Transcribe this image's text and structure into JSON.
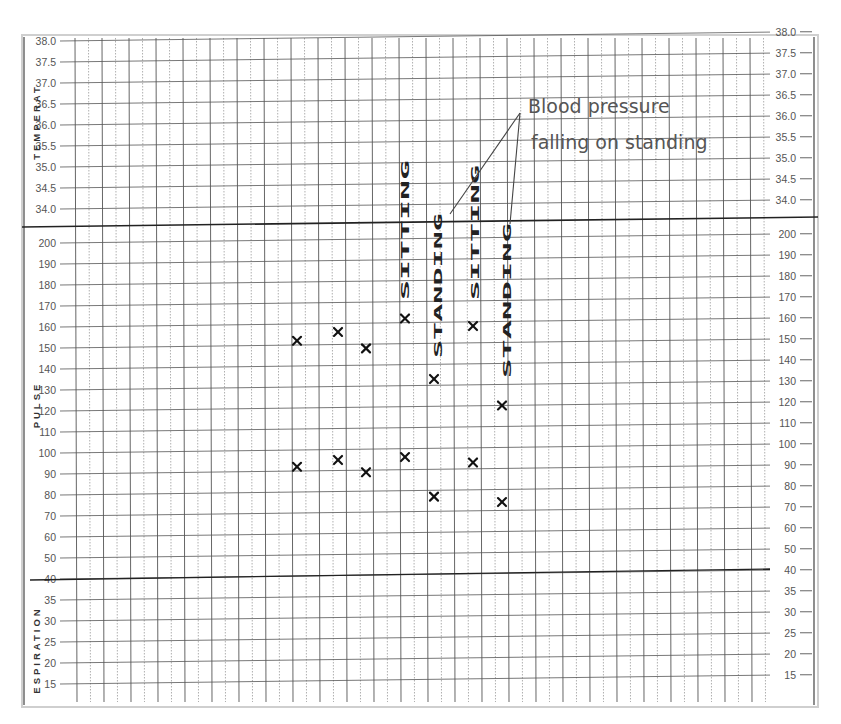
{
  "chart_data": {
    "type": "scatter",
    "sections": [
      {
        "name": "TEMPERAT",
        "ticks": [
          "38.0",
          "37.5",
          "37.0",
          "36.5",
          "36.0",
          "35.5",
          "35.0",
          "34.5",
          "34.0"
        ],
        "ylim": [
          34.0,
          38.0
        ]
      },
      {
        "name": "PULSE",
        "ticks": [
          "200",
          "190",
          "180",
          "170",
          "160",
          "150",
          "140",
          "130",
          "120",
          "110",
          "100",
          "90",
          "80",
          "70",
          "60",
          "50",
          "40"
        ],
        "ylim": [
          40,
          200
        ]
      },
      {
        "name": "ESPIRATION",
        "ticks": [
          "35",
          "30",
          "25",
          "20",
          "15"
        ],
        "ylim": [
          15,
          40
        ]
      }
    ],
    "series": [
      {
        "name": "Systolic BP (upper X)",
        "x": [
          1,
          2,
          3,
          4,
          5,
          6,
          7
        ],
        "values": [
          152,
          156,
          148,
          162,
          133,
          158,
          120
        ]
      },
      {
        "name": "Diastolic BP (lower X)",
        "x": [
          1,
          2,
          3,
          4,
          5,
          6,
          7
        ],
        "values": [
          92,
          95,
          89,
          96,
          77,
          93,
          74
        ]
      }
    ],
    "column_annotations": [
      {
        "column": 4,
        "text": "SITTING"
      },
      {
        "column": 5,
        "text": "STANDING"
      },
      {
        "column": 6,
        "text": "SITTING"
      },
      {
        "column": 7,
        "text": "STANDING"
      }
    ],
    "annotation": "Blood pressure falling on standing",
    "grid": true,
    "xlabel": "",
    "ylabel": ""
  },
  "labels": {
    "temperature": "TEMPERAT",
    "pulse": "PULSE",
    "respiration": "ESPIRATION",
    "annotation_line1": "Blood pressure",
    "annotation_line2": "falling on standing",
    "sitting": "SITTING",
    "standing": "STANDING"
  },
  "colors": {
    "grid": "#555555",
    "grid_minor": "#9a9a9a",
    "marker": "#111111",
    "annotation": "#555555"
  }
}
